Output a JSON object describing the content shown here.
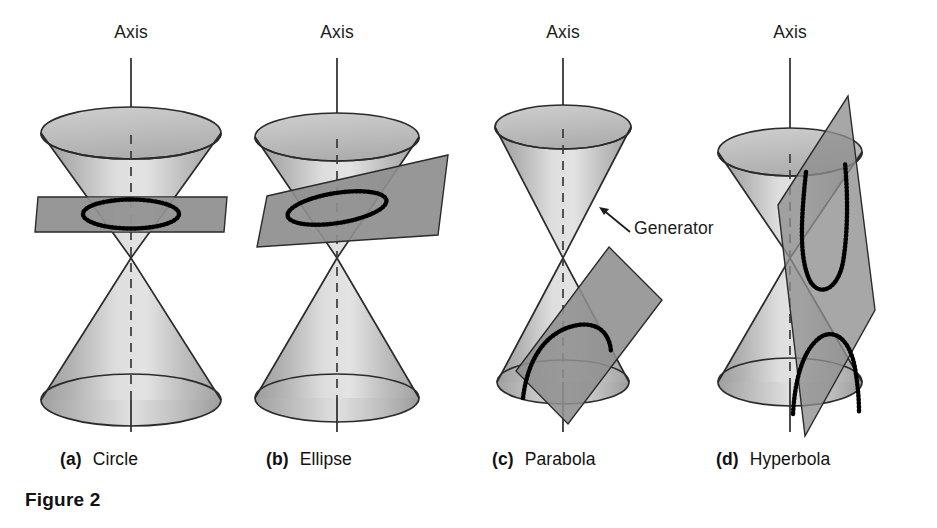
{
  "figure": {
    "caption": "Figure 2",
    "caption_x": 25,
    "caption_y": 489,
    "background_color": "#ffffff",
    "ink_color": "#1a1a1a"
  },
  "style": {
    "cone_light": "#e6e6e6",
    "cone_mid": "#b9b9b9",
    "cone_dark": "#9a9a9a",
    "cone_rim_fill": "#c2c2c2",
    "plane_fill": "#8e8e8e",
    "plane_stroke": "#2b2b2b",
    "outline": "#2b2b2b",
    "curve_color": "#000000"
  },
  "axis_label_text": "Axis",
  "panels": [
    {
      "id": "circle",
      "tag": "(a)",
      "name": "Circle",
      "axis_label": "Axis",
      "axis_x": 131,
      "axis_label_y": 22,
      "caption_x": 60,
      "caption_y": 449,
      "conic_type": "circle",
      "plane_orientation": "horizontal",
      "plane_description": "horizontal plane perpendicular to the axis cutting the upper nappe",
      "curve_description": "dotted circle shown in perspective as a horizontal ellipse"
    },
    {
      "id": "ellipse",
      "tag": "(b)",
      "name": "Ellipse",
      "axis_label": "Axis",
      "axis_x": 337,
      "axis_label_y": 22,
      "caption_x": 266,
      "caption_y": 449,
      "conic_type": "ellipse",
      "plane_orientation": "tilted",
      "plane_description": "plane tilted obliquely to the axis cutting entirely through the upper nappe",
      "curve_description": "dotted tilted ellipse"
    },
    {
      "id": "parabola",
      "tag": "(c)",
      "name": "Parabola",
      "axis_label": "Axis",
      "axis_x": 563,
      "axis_label_y": 22,
      "caption_x": 492,
      "caption_y": 449,
      "conic_type": "parabola",
      "plane_orientation": "parallel-to-generator",
      "plane_description": "plane parallel to a generator cutting the lower nappe",
      "curve_description": "dotted open parabolic arc",
      "annotation": {
        "label": "Generator",
        "label_x": 634,
        "label_y": 218,
        "arrow_from_x": 630,
        "arrow_from_y": 232,
        "arrow_to_x": 600,
        "arrow_to_y": 208
      }
    },
    {
      "id": "hyperbola",
      "tag": "(d)",
      "name": "Hyperbola",
      "axis_label": "Axis",
      "axis_x": 790,
      "axis_label_y": 22,
      "caption_x": 716,
      "caption_y": 449,
      "conic_type": "hyperbola",
      "plane_orientation": "steep-vertical",
      "plane_description": "steep near-vertical plane cutting both nappes of the double cone",
      "curve_description": "two dotted branches, an upward-opening branch in the upper nappe and a downward-opening branch in the lower nappe"
    }
  ]
}
